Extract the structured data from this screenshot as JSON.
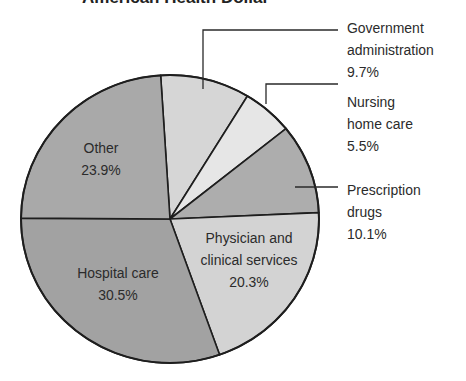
{
  "chart_data": {
    "type": "pie",
    "title": "American Health Dollar",
    "categories": [
      "Government administration",
      "Nursing home care",
      "Prescription drugs",
      "Physician and clinical services",
      "Hospital care",
      "Other"
    ],
    "values": [
      9.7,
      5.5,
      10.1,
      20.3,
      30.5,
      23.9
    ],
    "unit": "%",
    "colors": [
      "#d6d6d6",
      "#e6e6e6",
      "#adadad",
      "#d3d3d3",
      "#a2a2a2",
      "#a9a9a9"
    ],
    "legend": "none (direct labels with leader lines)"
  },
  "labels": {
    "govt": {
      "line1": "Government",
      "line2": "administration",
      "value": "9.7%"
    },
    "nursing": {
      "line1": "Nursing",
      "line2": "home care",
      "value": "5.5%"
    },
    "prescription": {
      "line1": "Prescription",
      "line2": "drugs",
      "value": "10.1%"
    },
    "physician": {
      "line1": "Physician and",
      "line2": "clinical services",
      "value": "20.3%"
    },
    "hospital": {
      "line1": "Hospital care",
      "value": "30.5%"
    },
    "other": {
      "line1": "Other",
      "value": "23.9%"
    }
  }
}
